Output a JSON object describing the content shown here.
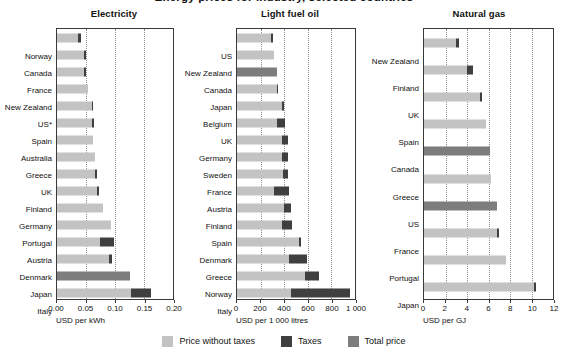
{
  "figure": {
    "title": "Energy prices for industry, selected countries",
    "legend": [
      {
        "label": "Price without taxes",
        "color": "#c3c3c3",
        "key": "base"
      },
      {
        "label": "Taxes",
        "color": "#3f3f3f",
        "key": "tax"
      },
      {
        "label": "Total price",
        "color": "#7d7d7d",
        "key": "total"
      }
    ]
  },
  "chart_data": [
    {
      "type": "bar",
      "title": "Electricity",
      "xlabel": "USD per kWh",
      "ylabel": "",
      "xlim": [
        0,
        0.2
      ],
      "xticks": [
        0,
        0.05,
        0.1,
        0.15,
        0.2
      ],
      "xticklabels": [
        "0.00",
        "0.05",
        "0.10",
        "0.15",
        "0.20"
      ],
      "grid": true,
      "stacked": true,
      "orientation": "horizontal",
      "categories": [
        "Norway",
        "Canada",
        "France",
        "New Zealand",
        "US*",
        "Spain",
        "Australia",
        "Greece",
        "UK",
        "Finland",
        "Germany",
        "Portugal",
        "Austria",
        "Denmark",
        "Japan",
        "Italy"
      ],
      "series": [
        {
          "name": "Price without taxes",
          "values": [
            0.036,
            0.047,
            0.047,
            0.053,
            0.06,
            0.06,
            0.062,
            0.065,
            0.066,
            0.069,
            0.079,
            0.093,
            0.074,
            0.09,
            null,
            0.127
          ]
        },
        {
          "name": "Taxes",
          "values": [
            0.005,
            0.003,
            0.003,
            0.0,
            0.002,
            0.003,
            0.0,
            0.0,
            0.003,
            0.003,
            0.0,
            0.0,
            0.024,
            0.005,
            null,
            0.035
          ]
        },
        {
          "name": "Total price",
          "values": [
            null,
            null,
            null,
            null,
            null,
            null,
            null,
            null,
            null,
            null,
            null,
            null,
            null,
            null,
            0.125,
            null
          ]
        }
      ],
      "totals": [
        0.041,
        0.05,
        0.05,
        0.053,
        0.062,
        0.063,
        0.062,
        0.065,
        0.069,
        0.072,
        0.079,
        0.093,
        0.098,
        0.095,
        0.125,
        0.162
      ]
    },
    {
      "type": "bar",
      "title": "Light fuel oil",
      "xlabel": "USD per 1 000 litres",
      "ylabel": "",
      "xlim": [
        0,
        1000
      ],
      "xticks": [
        0,
        200,
        400,
        600,
        800,
        1000
      ],
      "xticklabels": [
        "0",
        "200",
        "400",
        "600",
        "800",
        "1 000"
      ],
      "grid": true,
      "stacked": true,
      "orientation": "horizontal",
      "categories": [
        "US",
        "New Zealand",
        "Canada",
        "Japan",
        "Belgium",
        "UK",
        "Germany",
        "Sweden",
        "France",
        "Austria",
        "Finland",
        "Spain",
        "Denmark",
        "Greece",
        "Norway",
        "Italy"
      ],
      "series": [
        {
          "name": "Price without taxes",
          "values": [
            290,
            310,
            null,
            340,
            385,
            340,
            385,
            385,
            390,
            310,
            400,
            385,
            525,
            440,
            580,
            455
          ]
        },
        {
          "name": "Taxes",
          "values": [
            15,
            0,
            null,
            8,
            10,
            65,
            45,
            45,
            40,
            130,
            60,
            85,
            15,
            155,
            115,
            500
          ]
        },
        {
          "name": "Total price",
          "values": [
            null,
            null,
            335,
            null,
            null,
            null,
            null,
            null,
            null,
            null,
            null,
            null,
            null,
            null,
            null,
            null
          ]
        }
      ],
      "totals": [
        305,
        310,
        335,
        348,
        395,
        405,
        430,
        430,
        430,
        440,
        460,
        470,
        540,
        595,
        695,
        955
      ]
    },
    {
      "type": "bar",
      "title": "Natural gas",
      "xlabel": "USD per GJ",
      "ylabel": "",
      "xlim": [
        0,
        12
      ],
      "xticks": [
        0,
        2,
        4,
        6,
        8,
        10,
        12
      ],
      "xticklabels": [
        "0",
        "2",
        "4",
        "6",
        "8",
        "10",
        "12"
      ],
      "grid": true,
      "stacked": true,
      "orientation": "horizontal",
      "categories": [
        "New Zealand",
        "Finland",
        "UK",
        "Spain",
        "Canada",
        "Greece",
        "US",
        "France",
        "Portugal",
        "Japan"
      ],
      "series": [
        {
          "name": "Price without taxes",
          "values": [
            3.0,
            4.0,
            5.2,
            5.8,
            null,
            6.2,
            null,
            6.8,
            7.6,
            10.2
          ]
        },
        {
          "name": "Taxes",
          "values": [
            0.3,
            0.6,
            0.2,
            0.0,
            null,
            0.0,
            null,
            0.2,
            0.0,
            0.25
          ]
        },
        {
          "name": "Total price",
          "values": [
            null,
            null,
            null,
            null,
            6.1,
            null,
            6.8,
            null,
            null,
            null
          ]
        }
      ],
      "totals": [
        3.3,
        4.6,
        5.4,
        5.8,
        6.1,
        6.2,
        6.8,
        7.0,
        7.6,
        10.45
      ]
    }
  ]
}
